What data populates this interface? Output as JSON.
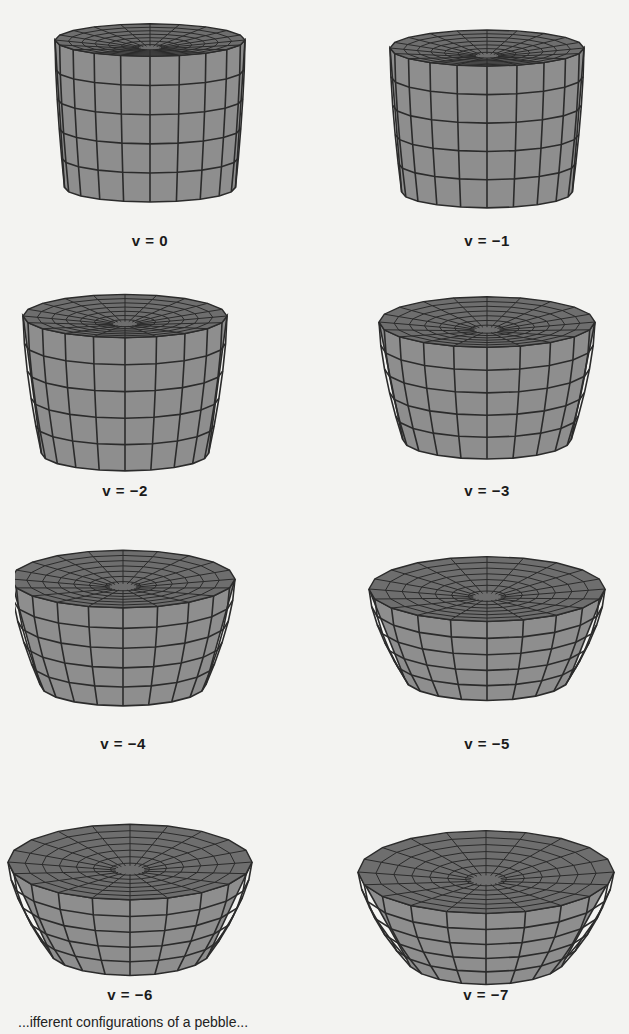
{
  "figure": {
    "panels": [
      {
        "var": "v",
        "value": "0",
        "label": "v = 0"
      },
      {
        "var": "v",
        "value": "−1",
        "label": "v = −1"
      },
      {
        "var": "v",
        "value": "−2",
        "label": "v = −2"
      },
      {
        "var": "v",
        "value": "−3",
        "label": "v = −3"
      },
      {
        "var": "v",
        "value": "−4",
        "label": "v = −4"
      },
      {
        "var": "v",
        "value": "−5",
        "label": "v = −5"
      },
      {
        "var": "v",
        "value": "−6",
        "label": "v = −6"
      },
      {
        "var": "v",
        "value": "−7",
        "label": "v = −7"
      }
    ],
    "caption_partial": "...ifferent configurations of a pebble..."
  },
  "colors": {
    "background": "#f3f3f1",
    "surface": "#8e8e8e",
    "surface_top": "#6e6e6e",
    "mesh_line": "#2b2b2b"
  }
}
